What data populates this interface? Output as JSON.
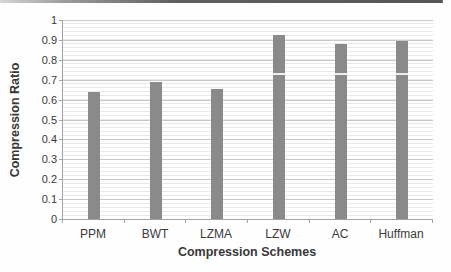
{
  "chart_data": {
    "type": "bar",
    "title": "",
    "categories": [
      "PPM",
      "BWT",
      "LZMA",
      "LZW",
      "AC",
      "Huffman"
    ],
    "values": [
      0.64,
      0.69,
      0.655,
      0.925,
      0.88,
      0.895
    ],
    "xlabel": "Compression Schemes",
    "ylabel": "Compression Ratio",
    "ylim": [
      0,
      1
    ],
    "ytick_step": 0.1,
    "ytick_labels": [
      "0",
      "0.1",
      "0.2",
      "0.3",
      "0.4",
      "0.5",
      "0.6",
      "0.7",
      "0.8",
      "0.9",
      "1"
    ],
    "grid": true,
    "legend": false,
    "colors": {
      "bar": "#8a8a8a",
      "major_gridline": "#c9c9c9",
      "axis_line": "#a3a3a3",
      "text": "#3a3a3a"
    }
  }
}
